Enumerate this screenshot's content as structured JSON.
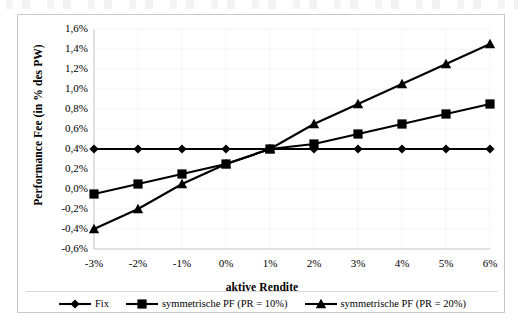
{
  "chart_data": {
    "type": "line",
    "title": "",
    "xlabel": "aktive Rendite",
    "ylabel": "Performance Fee (in % des PW)",
    "x": [
      -3,
      -2,
      -1,
      0,
      1,
      2,
      3,
      4,
      5,
      6
    ],
    "x_tick_labels": [
      "-3%",
      "-2%",
      "-1%",
      "0%",
      "1%",
      "2%",
      "3%",
      "4%",
      "5%",
      "6%"
    ],
    "y_tick_labels": [
      "1,6%",
      "1,4%",
      "1,2%",
      "1,0%",
      "0,8%",
      "0,6%",
      "0,4%",
      "0,2%",
      "0,0%",
      "-0,2%",
      "-0,4%",
      "-0,6%"
    ],
    "y_tick_values": [
      1.6,
      1.4,
      1.2,
      1.0,
      0.8,
      0.6,
      0.4,
      0.2,
      0.0,
      -0.2,
      -0.4,
      -0.6
    ],
    "ylim": [
      -0.6,
      1.6
    ],
    "xlim": [
      -3,
      6
    ],
    "grid": true,
    "legend_position": "bottom",
    "series": [
      {
        "name": "Fix",
        "marker": "diamond",
        "color": "#000000",
        "values": [
          0.4,
          0.4,
          0.4,
          0.4,
          0.4,
          0.4,
          0.4,
          0.4,
          0.4,
          0.4
        ]
      },
      {
        "name": "symmetrische PF (PR = 10%)",
        "marker": "square",
        "color": "#000000",
        "values": [
          -0.05,
          0.05,
          0.15,
          0.25,
          0.4,
          0.45,
          0.55,
          0.65,
          0.75,
          0.85
        ]
      },
      {
        "name": "symmetrische PF (PR = 20%)",
        "marker": "triangle",
        "color": "#000000",
        "values": [
          -0.4,
          -0.2,
          0.05,
          0.25,
          0.4,
          0.65,
          0.85,
          1.05,
          1.25,
          1.45
        ]
      }
    ]
  },
  "legend": {
    "items": [
      {
        "label": "Fix"
      },
      {
        "label": "symmetrische PF (PR = 10%)"
      },
      {
        "label": "symmetrische PF (PR = 20%)"
      }
    ]
  },
  "colors": {
    "series": "#000000",
    "frame_border": "#c9c9c9",
    "gridline": "#d9d9d9",
    "background": "#ffffff"
  }
}
